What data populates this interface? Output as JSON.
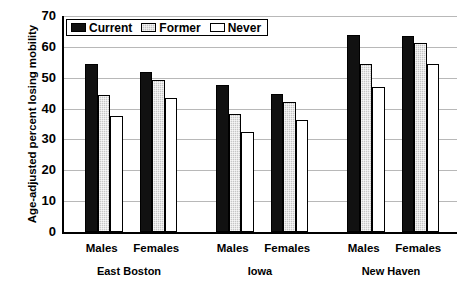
{
  "chart_data": {
    "type": "bar",
    "title": "",
    "xlabel": "",
    "ylabel": "Age-adjusted percent losing mobility",
    "ylim": [
      0,
      70
    ],
    "ytick_labels": [
      "70",
      "60",
      "50",
      "40",
      "30",
      "20",
      "10",
      "0"
    ],
    "ytick_values": [
      70,
      60,
      50,
      40,
      30,
      20,
      10,
      0
    ],
    "grid": true,
    "legend_position": "top-left",
    "groups": [
      "East Boston",
      "Iowa",
      "New Haven"
    ],
    "subgroups": [
      "Males",
      "Females"
    ],
    "categories": [
      "East Boston Males",
      "East Boston Females",
      "Iowa Males",
      "Iowa Females",
      "New Haven Males",
      "New Haven Females"
    ],
    "series": [
      {
        "name": "Current",
        "color": "#111111",
        "values": [
          54.4,
          51.8,
          47.5,
          44.6,
          63.8,
          63.4
        ]
      },
      {
        "name": "Former",
        "color": "#c6c6c6",
        "values": [
          44.4,
          49.3,
          38.3,
          42.2,
          54.3,
          61.2
        ]
      },
      {
        "name": "Never",
        "color": "#ffffff",
        "values": [
          37.6,
          43.5,
          32.3,
          36.4,
          47.1,
          54.6
        ]
      }
    ]
  },
  "legend": {
    "items": [
      {
        "label": "Current",
        "swatch": "black-filled-swatch"
      },
      {
        "label": "Former",
        "swatch": "gray-hatched-swatch"
      },
      {
        "label": "Never",
        "swatch": "white-empty-swatch"
      }
    ]
  },
  "axis": {
    "y_title": "Age-adjusted percent losing mobility"
  }
}
